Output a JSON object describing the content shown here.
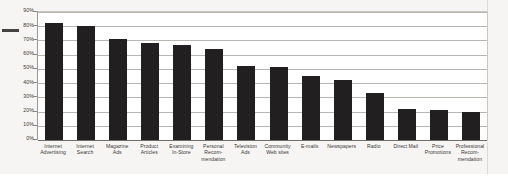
{
  "chart_data": {
    "type": "bar",
    "title": "",
    "xlabel": "",
    "ylabel": "",
    "ylim": [
      0,
      90
    ],
    "ytick_labels": [
      "90%",
      "80%",
      "70%",
      "60%",
      "50%",
      "40%",
      "30%",
      "20%",
      "10%",
      "0%"
    ],
    "ytick_values": [
      90,
      80,
      70,
      60,
      50,
      40,
      30,
      20,
      10,
      0
    ],
    "grid": true,
    "legend": "none",
    "bar_color": "#221f20",
    "categories": [
      "Internet Advertising",
      "Internet Search",
      "Magazine Ads",
      "Product Articles",
      "Examining In-Store",
      "Personal Recom- mendation",
      "Television Ads",
      "Community Web sites",
      "E-mails",
      "Newspapers",
      "Radio",
      "Direct Mail",
      "Price Promotions",
      "Professional Recom- mendation"
    ],
    "values": [
      82,
      80,
      71,
      68,
      67,
      64,
      52,
      51,
      45,
      42,
      33,
      22,
      21,
      20
    ]
  },
  "categories_display": [
    [
      "Internet",
      "Advertising"
    ],
    [
      "Internet",
      "Search"
    ],
    [
      "Magazine",
      "Ads"
    ],
    [
      "Product",
      "Articles"
    ],
    [
      "Examining",
      "In-Store"
    ],
    [
      "Personal",
      "Recom-",
      "mendation"
    ],
    [
      "Television",
      "Ads"
    ],
    [
      "Community",
      "Web sites"
    ],
    [
      "E-mails"
    ],
    [
      "Newspapers"
    ],
    [
      "Radio"
    ],
    [
      "Direct Mail"
    ],
    [
      "Price",
      "Promotions"
    ],
    [
      "Professional",
      "Recom-",
      "mendation"
    ]
  ],
  "colors": {
    "bar": "#221f20",
    "gridline": "#b9b6b2",
    "axis": "#6f6c68",
    "page_background": "#f6f5f3",
    "plot_background": "#ffffff",
    "text": "#3a3836"
  }
}
